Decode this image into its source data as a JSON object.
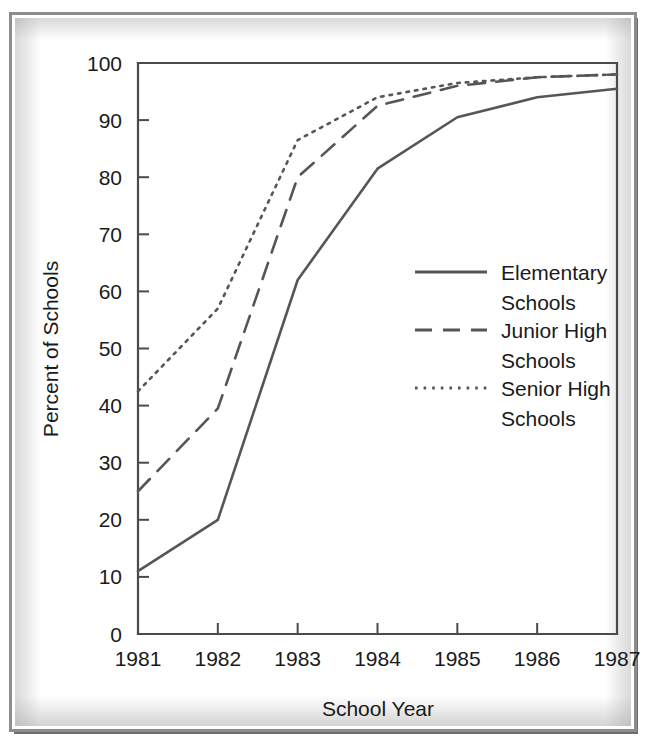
{
  "figure": {
    "background_color": "#ffffff",
    "frame_color": "#8d8d8d",
    "ink_color": "#565656"
  },
  "chart_data": {
    "type": "line",
    "title": "",
    "xlabel": "School Year",
    "ylabel": "Percent of Schools",
    "categories": [
      "1981",
      "1982",
      "1983",
      "1984",
      "1985",
      "1986",
      "1987"
    ],
    "x": [
      1981,
      1982,
      1983,
      1984,
      1985,
      1986,
      1987
    ],
    "xlim": [
      1981,
      1987
    ],
    "ylim": [
      0,
      100
    ],
    "yticks": [
      0,
      10,
      20,
      30,
      40,
      50,
      60,
      70,
      80,
      90,
      100
    ],
    "ytick_labels": [
      "0",
      "10",
      "20",
      "30",
      "40",
      "50",
      "60",
      "70",
      "80",
      "90",
      "100"
    ],
    "xtick_labels": [
      "1981",
      "1982",
      "1983",
      "1984",
      "1985",
      "1986",
      "1987"
    ],
    "grid": false,
    "legend_position": "center-right",
    "series": [
      {
        "name": "Elementary Schools",
        "style": "solid",
        "color": "#565656",
        "values": [
          11,
          20,
          62,
          81.5,
          90.5,
          94,
          95.5
        ]
      },
      {
        "name": "Junior High Schools",
        "style": "dashed",
        "color": "#565656",
        "values": [
          25,
          39.5,
          80,
          92.5,
          96,
          97.5,
          98
        ]
      },
      {
        "name": "Senior High Schools",
        "style": "dotted",
        "color": "#565656",
        "values": [
          42.5,
          57,
          86.5,
          94,
          96.5,
          97.5,
          98
        ]
      }
    ]
  },
  "legend": {
    "entries": [
      {
        "label_line1": "Elementary",
        "label_line2": "Schools",
        "style": "solid"
      },
      {
        "label_line1": "Junior High",
        "label_line2": "Schools",
        "style": "dashed"
      },
      {
        "label_line1": "Senior High",
        "label_line2": "Schools",
        "style": "dotted"
      }
    ]
  }
}
